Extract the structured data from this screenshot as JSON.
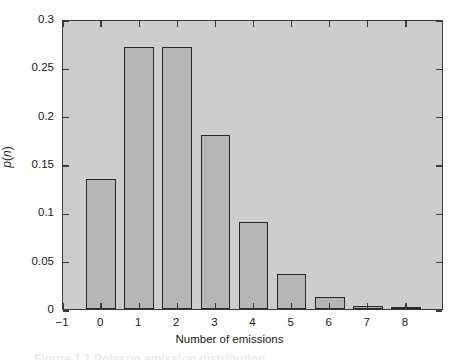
{
  "figure": {
    "background_color": "#ffffff",
    "plot_background_color": "#cdcdcd",
    "bar_fill_color": "#b6b6b6",
    "bar_edge_color": "#262626",
    "axis_color": "#3a3a3a"
  },
  "chart_data": {
    "type": "bar",
    "title": "",
    "subtitle": "",
    "xlabel": "Number of emissions",
    "ylabel": "p(n)",
    "categories": [
      "0",
      "1",
      "2",
      "3",
      "4",
      "5",
      "6",
      "7",
      "8"
    ],
    "values": [
      0.135,
      0.271,
      0.271,
      0.18,
      0.09,
      0.036,
      0.012,
      0.003,
      0.001
    ],
    "xlim": [
      -1,
      9
    ],
    "ylim": [
      0,
      0.3
    ],
    "xticks": [
      "-1",
      "0",
      "1",
      "2",
      "3",
      "4",
      "5",
      "6",
      "7",
      "8"
    ],
    "xtick_values": [
      -1,
      0,
      1,
      2,
      3,
      4,
      5,
      6,
      7,
      8
    ],
    "yticks": [
      "0",
      "0.05",
      "0.1",
      "0.15",
      "0.2",
      "0.25",
      "0.3"
    ],
    "ytick_values": [
      0,
      0.05,
      0.1,
      0.15,
      0.2,
      0.25,
      0.3
    ],
    "grid": false,
    "legend": null,
    "legend_position": "none",
    "annotations": [],
    "tick_direction": "in",
    "bar_width_fraction": 0.78
  },
  "caption": {
    "remnant_text": "Figure 1.1  Poisson emission distribution"
  }
}
